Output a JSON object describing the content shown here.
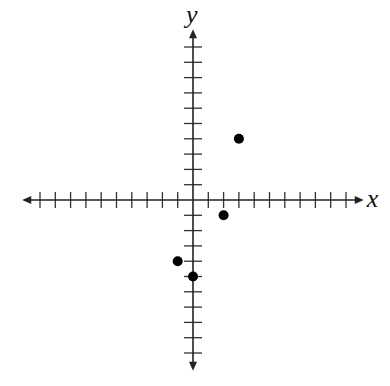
{
  "chart_data": {
    "type": "scatter",
    "title": "",
    "xlabel": "x",
    "ylabel": "y",
    "xlim": [
      -10,
      10
    ],
    "ylim": [
      -10,
      10
    ],
    "grid": false,
    "tick_step": 1,
    "tick_labels": false,
    "series": [
      {
        "name": "points",
        "points": [
          {
            "x": 3,
            "y": 4
          },
          {
            "x": 2,
            "y": -1
          },
          {
            "x": -1,
            "y": -4
          },
          {
            "x": 0,
            "y": -5
          }
        ]
      }
    ]
  },
  "layout": {
    "origin": [
      193,
      200
    ],
    "unit": 15.3,
    "colors": {
      "axis": "#222222",
      "point": "#000000"
    }
  }
}
